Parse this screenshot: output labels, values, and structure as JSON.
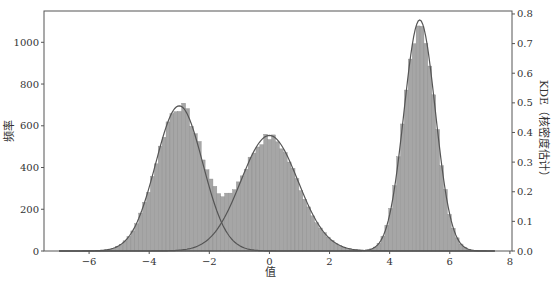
{
  "chart_data": {
    "type": "bar",
    "subtype": "histogram_with_kde",
    "title": "",
    "xlabel": "值",
    "ylabel": "频率",
    "y2label": "KDE（核密度估计）",
    "xlim": [
      -7.5,
      8.07
    ],
    "ylim": [
      0,
      1150
    ],
    "y2lim": [
      0,
      0.81
    ],
    "xticks": [
      -6,
      -4,
      -2,
      0,
      2,
      4,
      6,
      8
    ],
    "yticks": [
      0,
      200,
      400,
      600,
      800,
      1000
    ],
    "y2ticks": [
      0.0,
      0.1,
      0.2,
      0.3,
      0.4,
      0.5,
      0.6,
      0.7,
      0.8
    ],
    "grid": false,
    "legend": null,
    "bin_width": 0.13,
    "histogram_components": [
      {
        "name": "mode_1",
        "mean": -3.0,
        "sd": 0.78,
        "peak_count": 690
      },
      {
        "name": "mode_2",
        "mean": 0.0,
        "sd": 0.95,
        "peak_count": 545
      },
      {
        "name": "mode_3",
        "mean": 5.0,
        "sd": 0.52,
        "peak_count": 1100
      }
    ],
    "series": [
      {
        "name": "Histogram (频率)",
        "axis": "left",
        "peaks": [
          {
            "x": -3.0,
            "y": 690
          },
          {
            "x": 0.0,
            "y": 550
          },
          {
            "x": 5.0,
            "y": 1100
          }
        ],
        "local_min": {
          "x": -1.5,
          "y": 255
        }
      },
      {
        "name": "KDE component 1",
        "axis": "right",
        "mean": -3.0,
        "sd": 0.78,
        "peak": 0.49
      },
      {
        "name": "KDE component 2",
        "axis": "right",
        "mean": 0.0,
        "sd": 0.95,
        "peak": 0.39
      },
      {
        "name": "KDE component 3",
        "axis": "right",
        "mean": 5.0,
        "sd": 0.52,
        "peak": 0.78
      }
    ],
    "colors": {
      "bar_fill": "#a6a6a6",
      "bar_edge": "#8c8c8c",
      "kde_line": "#555555",
      "axis": "#333333"
    }
  }
}
